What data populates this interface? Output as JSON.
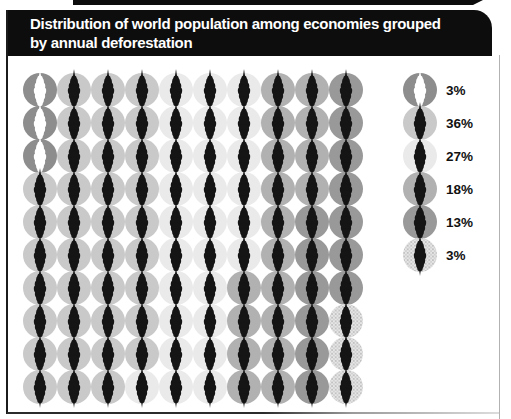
{
  "title": {
    "line1": "Distribution of world population among economies grouped",
    "line2": "by annual deforestation"
  },
  "chart_data": {
    "type": "pictogram-unit-chart",
    "title": "Distribution of world population among economies grouped by annual deforestation",
    "unit": "1 circle = 1% of world population",
    "total_units": 100,
    "grid": {
      "columns": 10,
      "rows": 10,
      "fill_order": "column-major-top-to-bottom-left-to-right"
    },
    "series": [
      {
        "name": "group-1",
        "percent": 3,
        "label": "3%",
        "circle_color": "#8d8d8d",
        "glyph_color": "#ffffff",
        "pattern": "solid"
      },
      {
        "name": "group-2",
        "percent": 36,
        "label": "36%",
        "circle_color": "#c9c9c9",
        "glyph_color": "#151515",
        "pattern": "solid"
      },
      {
        "name": "group-3",
        "percent": 27,
        "label": "27%",
        "circle_color": "#eaeaea",
        "glyph_color": "#151515",
        "pattern": "solid"
      },
      {
        "name": "group-4",
        "percent": 18,
        "label": "18%",
        "circle_color": "#b1b1b1",
        "glyph_color": "#151515",
        "pattern": "solid"
      },
      {
        "name": "group-5",
        "percent": 13,
        "label": "13%",
        "circle_color": "#999999",
        "glyph_color": "#151515",
        "pattern": "solid"
      },
      {
        "name": "group-6",
        "percent": 3,
        "label": "3%",
        "circle_color": "#e2e2e2",
        "glyph_color": "#151515",
        "pattern": "halftone"
      }
    ],
    "legend_position": "right"
  },
  "layout_colors": {
    "header_bg": "#0d0d0d",
    "header_text": "#ffffff",
    "page_bg": "#ffffff"
  }
}
